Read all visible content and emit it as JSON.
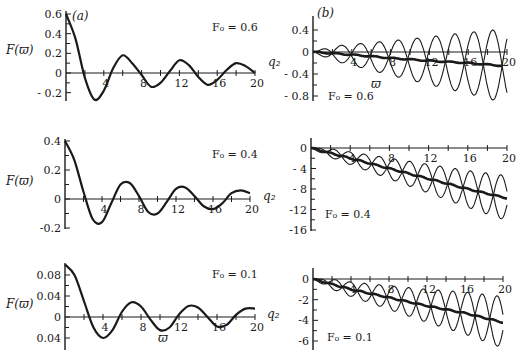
{
  "figure": {
    "panel_a_label": "(a)",
    "panel_b_label": "(b)",
    "xlabel_symbol": "ϖ"
  },
  "chart_data": [
    {
      "id": "a1",
      "type": "line",
      "panel": "(a)",
      "annotation": "F₀ = 0.6",
      "ylabel": "F(ϖ)",
      "xlabel": "",
      "xlim": [
        0,
        20
      ],
      "ylim": [
        -0.28,
        0.6
      ],
      "xticks": [
        4,
        8,
        12,
        16,
        20
      ],
      "xtick_labels": [
        "4",
        "8",
        "12",
        "16",
        "20"
      ],
      "yticks": [
        0.6,
        0.4,
        0.2,
        0,
        -0.2
      ],
      "ytick_labels": [
        "0.6",
        "0.4",
        "0.2",
        "0",
        "- 0.2"
      ],
      "series": [
        {
          "name": "F(ϖ)",
          "x": [
            0,
            1,
            2,
            3,
            4,
            5,
            6,
            7,
            8,
            9,
            10,
            11,
            12,
            13,
            14,
            15,
            16,
            17,
            18,
            19,
            20
          ],
          "y": [
            0.6,
            0.35,
            -0.05,
            -0.27,
            -0.18,
            0.05,
            0.18,
            0.1,
            -0.02,
            -0.14,
            -0.1,
            0.02,
            0.13,
            0.08,
            -0.04,
            -0.12,
            -0.07,
            0.03,
            0.1,
            0.07,
            0.0
          ]
        }
      ]
    },
    {
      "id": "b1",
      "type": "line",
      "panel": "(b)",
      "annotation": "F₀ = 0.6",
      "ylabel": "q₂",
      "xlabel": "ϖ",
      "xlim": [
        0,
        20
      ],
      "ylim": [
        -0.95,
        0.55
      ],
      "xticks": [
        4,
        8,
        12,
        16,
        20
      ],
      "xtick_labels": [
        "4",
        "8",
        "12",
        "16",
        "20"
      ],
      "yticks": [
        0.4,
        0,
        -0.4,
        -0.8
      ],
      "ytick_labels": [
        "0.4",
        "0",
        "- 0.4",
        "- 0.8"
      ],
      "series": [
        {
          "name": "mean (thick)",
          "x": [
            0,
            4,
            8,
            12,
            16,
            19.5
          ],
          "y": [
            0,
            -0.05,
            -0.11,
            -0.16,
            -0.2,
            -0.25
          ]
        },
        {
          "name": "upper envelope oscillation",
          "amplitude_max": 0.45,
          "period": 3.9
        },
        {
          "name": "lower envelope oscillation",
          "amplitude_min": -0.92,
          "period": 3.9
        }
      ]
    },
    {
      "id": "a2",
      "type": "line",
      "panel": "(a)",
      "annotation": "F₀ = 0.4",
      "ylabel": "F(ϖ)",
      "xlabel": "",
      "xlim": [
        0,
        20
      ],
      "ylim": [
        -0.2,
        0.4
      ],
      "xticks": [
        4,
        8,
        12,
        16,
        20
      ],
      "xtick_labels": [
        "4",
        "8",
        "12",
        "16",
        "20"
      ],
      "yticks": [
        0.4,
        0.2,
        0,
        -0.2
      ],
      "ytick_labels": [
        "0.4",
        "0.2",
        "0",
        "-0.2"
      ],
      "series": [
        {
          "name": "F(ϖ)",
          "x": [
            0,
            1,
            2,
            3,
            4,
            5,
            6,
            7,
            8,
            9,
            10,
            11,
            12,
            13,
            14,
            15,
            16,
            17,
            18,
            19,
            20
          ],
          "y": [
            0.4,
            0.27,
            0.05,
            -0.14,
            -0.16,
            -0.03,
            0.1,
            0.11,
            0.02,
            -0.09,
            -0.1,
            -0.02,
            0.07,
            0.08,
            0.02,
            -0.05,
            -0.07,
            -0.03,
            0.04,
            0.06,
            0.04
          ]
        }
      ]
    },
    {
      "id": "b2",
      "type": "line",
      "panel": "(b)",
      "annotation": "F₀ = 0.4",
      "ylabel": "q₂",
      "xlabel": "",
      "xlim": [
        0,
        20
      ],
      "ylim": [
        -16,
        1
      ],
      "xticks": [
        4,
        8,
        12,
        16,
        20
      ],
      "xtick_labels": [
        "4",
        "8",
        "12",
        "16",
        "20"
      ],
      "yticks": [
        0,
        -4,
        -8,
        -12,
        -16
      ],
      "ytick_labels": [
        "0",
        "- 4",
        "- 8",
        "-12",
        "-16"
      ],
      "series": [
        {
          "name": "mean (thick)",
          "x": [
            0,
            4,
            8,
            12,
            16,
            20
          ],
          "y": [
            0,
            -2,
            -4,
            -6,
            -8,
            -9.8
          ]
        },
        {
          "name": "oscillation bounds",
          "upper_end": -5.5,
          "lower_end": -14.2,
          "period": 3.1
        }
      ]
    },
    {
      "id": "a3",
      "type": "line",
      "panel": "(a)",
      "annotation": "F₀ = 0.1",
      "ylabel": "F(ϖ)",
      "xlabel": "ϖ",
      "xlim": [
        0,
        20
      ],
      "ylim": [
        -0.045,
        0.1
      ],
      "xticks": [
        4,
        8,
        12,
        16,
        20
      ],
      "xtick_labels": [
        "4",
        "8",
        "12",
        "16",
        "20"
      ],
      "yticks": [
        0.08,
        0.04,
        0,
        -0.04
      ],
      "ytick_labels": [
        "0.08",
        "0.04",
        "0",
        "0.04"
      ],
      "series": [
        {
          "name": "F(ϖ)",
          "x": [
            0,
            1,
            2,
            3,
            4,
            5,
            6,
            7,
            8,
            9,
            10,
            11,
            12,
            13,
            14,
            15,
            16,
            17,
            18,
            19,
            20
          ],
          "y": [
            0.1,
            0.08,
            0.03,
            -0.02,
            -0.04,
            -0.025,
            0.01,
            0.028,
            0.02,
            -0.005,
            -0.025,
            -0.02,
            0.005,
            0.021,
            0.018,
            0.0,
            -0.018,
            -0.015,
            0.004,
            0.016,
            0.016
          ]
        }
      ]
    },
    {
      "id": "b3",
      "type": "line",
      "panel": "(b)",
      "annotation": "F₀ = 0.1",
      "ylabel": "q₂",
      "xlabel": "",
      "xlim": [
        0,
        20
      ],
      "ylim": [
        -7,
        0.8
      ],
      "xticks": [
        4,
        8,
        12,
        16,
        20
      ],
      "xtick_labels": [
        "4",
        "8",
        "12",
        "16",
        "20"
      ],
      "yticks": [
        0,
        -2,
        -4,
        -6
      ],
      "ytick_labels": [
        "0",
        "-2",
        "-4",
        "-6"
      ],
      "series": [
        {
          "name": "mean (thick)",
          "x": [
            0,
            4,
            8,
            12,
            16,
            20
          ],
          "y": [
            0,
            -1,
            -1.8,
            -2.6,
            -3.3,
            -4.2
          ]
        },
        {
          "name": "oscillation bounds",
          "upper_end": -1.5,
          "lower_end": -6.5,
          "period": 3.1
        }
      ]
    }
  ]
}
